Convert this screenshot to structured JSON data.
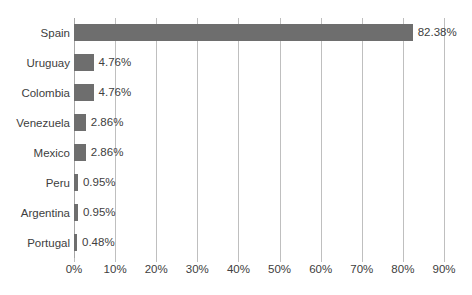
{
  "chart_data": {
    "type": "bar",
    "orientation": "horizontal",
    "title": "",
    "xlabel": "",
    "ylabel": "",
    "categories": [
      "Spain",
      "Uruguay",
      "Colombia",
      "Venezuela",
      "Mexico",
      "Peru",
      "Argentina",
      "Portugal"
    ],
    "values": [
      82.38,
      4.76,
      4.76,
      2.86,
      2.86,
      0.95,
      0.95,
      0.48
    ],
    "value_labels": [
      "82.38%",
      "4.76%",
      "4.76%",
      "2.86%",
      "2.86%",
      "0.95%",
      "0.95%",
      "0.48%"
    ],
    "xlim": [
      0,
      90
    ],
    "xtick_values": [
      0,
      10,
      20,
      30,
      40,
      50,
      60,
      70,
      80,
      90
    ],
    "xtick_labels": [
      "0%",
      "10%",
      "20%",
      "30%",
      "40%",
      "50%",
      "60%",
      "70%",
      "80%",
      "90%"
    ],
    "grid": true,
    "grid_axis": "x",
    "legend": false,
    "legend_position": "none",
    "bar_color": "#6e6e6e",
    "gridline_color": "#bfbfbf",
    "axis_line_color": "#a6a6a6",
    "text_color": "#404040",
    "background_color": "#ffffff"
  }
}
